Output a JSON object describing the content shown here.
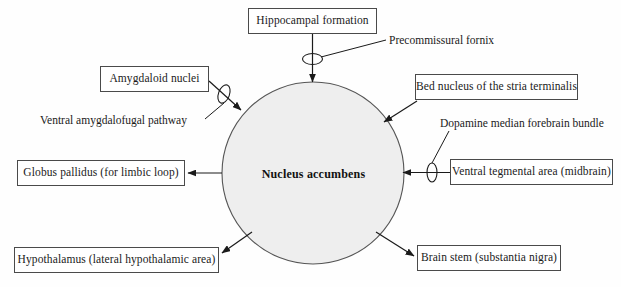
{
  "diagram": {
    "hub": {
      "label": "Nucleus accumbens",
      "shape": "circle",
      "fill": "#eeeeee",
      "stroke": "#555555",
      "cx": 313,
      "cy": 173,
      "r": 91
    },
    "nodes": [
      {
        "id": "hippocampal-formation",
        "label": "Hippocampal formation",
        "x": 248,
        "y": 8,
        "w": 129,
        "h": 26
      },
      {
        "id": "amygdaloid-nuclei",
        "label": "Amygdaloid nuclei",
        "x": 100,
        "y": 66,
        "w": 109,
        "h": 26
      },
      {
        "id": "bed-nucleus-stria-terminalis",
        "label": "Bed nucleus of the stria terminalis",
        "x": 415,
        "y": 74,
        "w": 163,
        "h": 26
      },
      {
        "id": "globus-pallidus",
        "label": "Globus pallidus (for limbic loop)",
        "x": 17,
        "y": 160,
        "w": 168,
        "h": 26
      },
      {
        "id": "ventral-tegmental-area",
        "label": "Ventral tegmental area (midbrain)",
        "x": 450,
        "y": 159,
        "w": 163,
        "h": 26
      },
      {
        "id": "hypothalamus",
        "label": "Hypothalamus (lateral hypothalamic area)",
        "x": 14,
        "y": 247,
        "w": 205,
        "h": 26
      },
      {
        "id": "brain-stem",
        "label": "Brain stem (substantia nigra)",
        "x": 417,
        "y": 245,
        "w": 144,
        "h": 26
      }
    ],
    "pathway_labels": [
      {
        "id": "precommissural-fornix",
        "label": "Precommissural fornix",
        "x": 389,
        "y": 41
      },
      {
        "id": "ventral-amygdalofugal-pathway",
        "label": "Ventral amygdalofugal pathway",
        "x": 40,
        "y": 121
      },
      {
        "id": "dopamine-median-forebrain-bundle",
        "label": "Dopamine median forebrain bundle",
        "x": 440,
        "y": 124
      }
    ],
    "colors": {
      "line": "#1a1a1a",
      "box_border": "#4a4a4a",
      "hub_fill": "#eeeeee",
      "hub_stroke": "#555555",
      "background": "#fefefe"
    }
  }
}
